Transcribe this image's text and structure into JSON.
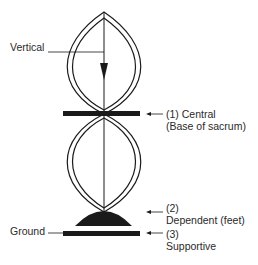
{
  "diagram": {
    "labels": {
      "vertical": "Vertical",
      "ground": "Ground",
      "central_line1": "(1) Central",
      "central_line2": "(Base of sacrum)",
      "dependent_line1": "(2)",
      "dependent_line2": "Dependent (feet)",
      "supportive_line1": "(3)",
      "supportive_line2": "Supportive"
    },
    "colors": {
      "ink": "#1a1a1a",
      "text": "#2a2a2a",
      "background": "#ffffff"
    }
  }
}
